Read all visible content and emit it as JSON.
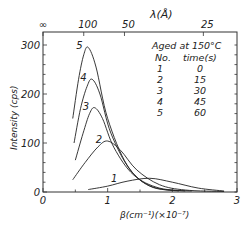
{
  "chart_data": {
    "type": "line",
    "title": "",
    "xlabel": "β(cm⁻¹)(×10⁻⁷)",
    "ylabel": "Intensity (cps)",
    "top_xlabel": "λ(Å)",
    "xlim": [
      0,
      3
    ],
    "ylim": [
      0,
      300
    ],
    "x_ticks": [
      "0",
      "1",
      "2",
      "3"
    ],
    "y_ticks": [
      "0",
      "100",
      "200",
      "300"
    ],
    "top_ticks": [
      {
        "label": "∞",
        "beta": 0.0
      },
      {
        "label": "100",
        "beta": 0.63
      },
      {
        "label": "50",
        "beta": 1.26
      },
      {
        "label": "25",
        "beta": 2.48
      }
    ],
    "grid": false,
    "legend": {
      "title": "Aged at 150°C",
      "header": [
        "No.",
        "time(s)"
      ],
      "rows": [
        {
          "no": "1",
          "time": "0"
        },
        {
          "no": "2",
          "time": "15"
        },
        {
          "no": "3",
          "time": "30"
        },
        {
          "no": "4",
          "time": "45"
        },
        {
          "no": "5",
          "time": "60"
        }
      ],
      "position": "upper right"
    },
    "series": [
      {
        "name": "1",
        "x": [
          0.7,
          1.0,
          1.3,
          1.65,
          2.0,
          2.4,
          2.8
        ],
        "y": [
          5,
          12,
          22,
          28,
          20,
          8,
          2
        ]
      },
      {
        "name": "2",
        "x": [
          0.46,
          0.65,
          0.85,
          1.0,
          1.2,
          1.45,
          1.8,
          2.2,
          2.8
        ],
        "y": [
          25,
          60,
          92,
          104,
          85,
          45,
          15,
          4,
          1
        ]
      },
      {
        "name": "3",
        "x": [
          0.5,
          0.62,
          0.72,
          0.8,
          0.92,
          1.1,
          1.4,
          1.8,
          2.3
        ],
        "y": [
          65,
          120,
          160,
          172,
          150,
          90,
          35,
          8,
          2
        ]
      },
      {
        "name": "4",
        "x": [
          0.48,
          0.58,
          0.68,
          0.76,
          0.88,
          1.05,
          1.35,
          1.7,
          2.2
        ],
        "y": [
          100,
          170,
          215,
          230,
          200,
          120,
          45,
          10,
          2
        ]
      },
      {
        "name": "5",
        "x": [
          0.46,
          0.55,
          0.63,
          0.7,
          0.82,
          1.0,
          1.3,
          1.65,
          2.1
        ],
        "y": [
          150,
          230,
          280,
          295,
          255,
          150,
          55,
          12,
          2
        ]
      }
    ]
  }
}
